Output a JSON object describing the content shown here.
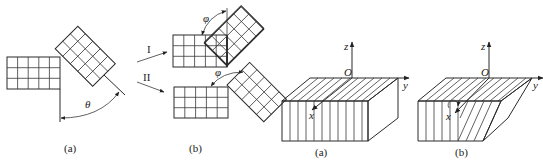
{
  "figure_left": {
    "panel_a": {
      "caption": "(a)",
      "angle_label": "θ",
      "grid_rect": {
        "cols": 5,
        "rows": 3
      },
      "grid_tilted": {
        "cols": 3,
        "rows": 5,
        "rotation_deg": 45
      }
    },
    "panel_b": {
      "caption": "(b)",
      "path_labels": [
        "I",
        "II"
      ],
      "angle_label": "φ",
      "configs": [
        {
          "name": "I",
          "grid_rect": {
            "cols": 5,
            "rows": 3
          },
          "grid_tilted": {
            "cols": 3,
            "rows": 5
          }
        },
        {
          "name": "II",
          "grid_rect": {
            "cols": 5,
            "rows": 3
          },
          "grid_tilted": {
            "cols": 3,
            "rows": 5
          }
        }
      ]
    }
  },
  "figure_right": {
    "panel_a": {
      "caption": "(a)",
      "axes": {
        "x": "x",
        "y": "y",
        "z": "z",
        "origin": "O"
      },
      "description": "rectangular block with vertical lamellae"
    },
    "panel_b": {
      "caption": "(b)",
      "axes": {
        "x": "x",
        "y": "y",
        "z": "z",
        "origin": "O"
      },
      "description": "sheared block with partially tilted lamellae"
    }
  }
}
